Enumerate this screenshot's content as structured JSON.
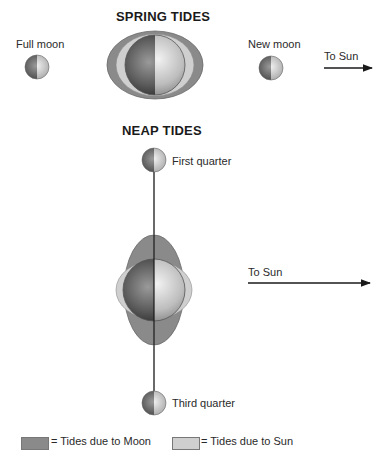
{
  "spring": {
    "title": "SPRING TIDES",
    "full_moon_label": "Full moon",
    "new_moon_label": "New moon",
    "sun_arrow_label": "To Sun"
  },
  "neap": {
    "title": "NEAP TIDES",
    "first_quarter_label": "First quarter",
    "third_quarter_label": "Third quarter",
    "sun_arrow_label": "To Sun"
  },
  "legend": {
    "moon_label": "= Tides due to Moon",
    "sun_label": "= Tides due to Sun",
    "moon_color": "#8a8a8a",
    "sun_color": "#cfcfcf"
  },
  "colors": {
    "moon_tide": "#8a8a8a",
    "sun_tide": "#cfcfcf",
    "line": "#1a1a1a"
  }
}
